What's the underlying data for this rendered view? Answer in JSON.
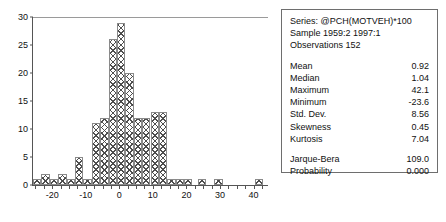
{
  "chart_data": {
    "type": "bar",
    "title": "",
    "xlabel": "",
    "ylabel": "",
    "xlim": [
      -26,
      44
    ],
    "ylim": [
      0,
      30
    ],
    "grid": false,
    "legend_position": "none",
    "bin_width": 2.5,
    "y_ticks": [
      0,
      5,
      10,
      15,
      20,
      25,
      30
    ],
    "y_tick_labels": [
      "0",
      "5",
      "10",
      "15",
      "20",
      "25",
      "30"
    ],
    "x_ticks": [
      -20,
      -10,
      0,
      10,
      20,
      30,
      40
    ],
    "x_tick_labels": [
      "-20",
      "-10",
      "0",
      "10",
      "20",
      "30",
      "40"
    ],
    "bins": [
      {
        "x0": -26.0,
        "x1": -23.5,
        "count": 1
      },
      {
        "x0": -23.5,
        "x1": -21.0,
        "count": 2
      },
      {
        "x0": -21.0,
        "x1": -18.5,
        "count": 1
      },
      {
        "x0": -18.5,
        "x1": -16.0,
        "count": 2
      },
      {
        "x0": -16.0,
        "x1": -13.5,
        "count": 1
      },
      {
        "x0": -13.5,
        "x1": -11.0,
        "count": 5
      },
      {
        "x0": -11.0,
        "x1": -8.5,
        "count": 1
      },
      {
        "x0": -8.5,
        "x1": -6.0,
        "count": 11
      },
      {
        "x0": -6.0,
        "x1": -3.5,
        "count": 12
      },
      {
        "x0": -3.5,
        "x1": -1.0,
        "count": 26
      },
      {
        "x0": -1.0,
        "x1": 1.5,
        "count": 29
      },
      {
        "x0": 1.5,
        "x1": 4.0,
        "count": 20
      },
      {
        "x0": 4.0,
        "x1": 6.5,
        "count": 12
      },
      {
        "x0": 6.5,
        "x1": 9.0,
        "count": 12
      },
      {
        "x0": 9.0,
        "x1": 11.5,
        "count": 13
      },
      {
        "x0": 11.5,
        "x1": 14.0,
        "count": 13
      },
      {
        "x0": 14.0,
        "x1": 16.5,
        "count": 1
      },
      {
        "x0": 16.5,
        "x1": 19.0,
        "count": 1
      },
      {
        "x0": 19.0,
        "x1": 21.5,
        "count": 1
      },
      {
        "x0": 23.0,
        "x1": 25.5,
        "count": 1
      },
      {
        "x0": 28.0,
        "x1": 30.5,
        "count": 1
      },
      {
        "x0": 40.0,
        "x1": 42.5,
        "count": 1
      }
    ]
  },
  "stats": {
    "series": "Series: @PCH(MOTVEH)*100",
    "sample": "Sample 1959:2 1997:1",
    "observations": "Observations 152",
    "rows": [
      {
        "label": "Mean",
        "value": "0.92"
      },
      {
        "label": "Median",
        "value": "1.04"
      },
      {
        "label": "Maximum",
        "value": "42.1"
      },
      {
        "label": "Minimum",
        "value": "-23.6"
      },
      {
        "label": "Std. Dev.",
        "value": "8.56"
      },
      {
        "label": "Skewness",
        "value": "0.45"
      },
      {
        "label": "Kurtosis",
        "value": "7.04"
      }
    ],
    "test_rows": [
      {
        "label": "Jarque-Bera",
        "value": "109.0"
      },
      {
        "label": "Probability",
        "value": "0.000"
      }
    ]
  }
}
